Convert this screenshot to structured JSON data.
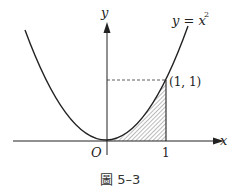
{
  "figure": {
    "caption": "圖 5–3",
    "curve_label_lhs": "y = x",
    "curve_label_exp": "2",
    "point_label": "(1, 1)",
    "x_axis_label": "x",
    "y_axis_label": "y",
    "origin_label": "O",
    "x_tick_label": "1",
    "shaded_region": "area under y = x^2 from x = 0 to x = 1",
    "colors": {
      "stroke": "#222222",
      "hatch": "#666666",
      "background": "#ffffff"
    }
  }
}
